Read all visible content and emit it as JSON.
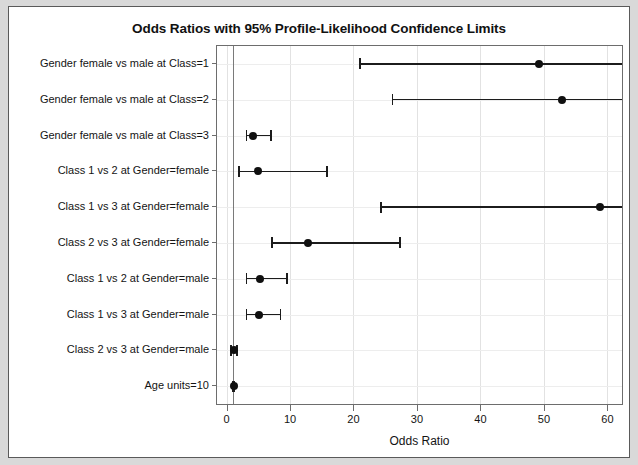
{
  "chart_data": {
    "type": "scatter",
    "title": "Odds Ratios with 95% Profile-Likelihood Confidence Limits",
    "xlabel": "Odds Ratio",
    "ylabel": "",
    "xlim": [
      -1.5,
      62.3
    ],
    "xticks": [
      0,
      10,
      20,
      30,
      40,
      50,
      60
    ],
    "xticklabels": [
      "0",
      "10",
      "20",
      "30",
      "40",
      "50",
      "60"
    ],
    "grid": true,
    "reference_line": 1,
    "legend": "none",
    "categories": [
      "Gender female vs male at Class=1",
      "Gender female vs male at Class=2",
      "Gender female vs male at Class=3",
      "Class 1 vs 2 at Gender=female",
      "Class 1 vs 3 at Gender=female",
      "Class 2 vs 3 at Gender=female",
      "Class 1 vs 2 at Gender=male",
      "Class 1 vs 3 at Gender=male",
      "Class 2 vs 3 at Gender=male",
      "Age units=10"
    ],
    "series": [
      {
        "name": "Odds Ratio estimate",
        "values": [
          49.3,
          52.9,
          4.2,
          4.9,
          58.9,
          12.9,
          5.3,
          5.1,
          1.2,
          1.1
        ]
      },
      {
        "name": "Lower 95% profile-likelihood limit",
        "values": [
          20.9,
          26.0,
          3.0,
          1.8,
          24.2,
          7.0,
          3.0,
          3.0,
          0.6,
          0.9
        ]
      },
      {
        "name": "Upper 95% profile-likelihood limit",
        "values": [
          64.0,
          64.0,
          7.1,
          16.0,
          64.0,
          27.5,
          9.7,
          8.6,
          1.8,
          1.4
        ]
      }
    ],
    "upper_truncated": [
      true,
      true,
      false,
      false,
      true,
      false,
      false,
      false,
      false,
      false
    ]
  }
}
